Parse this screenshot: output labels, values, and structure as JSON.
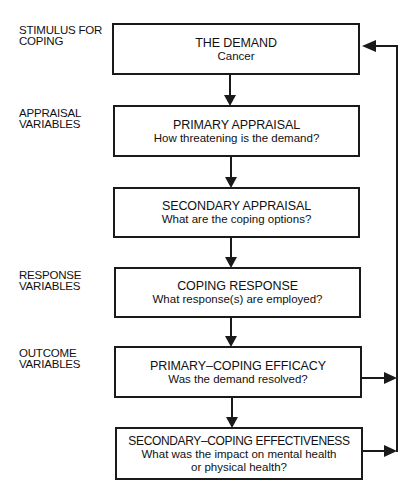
{
  "diagram": {
    "categories": [
      {
        "id": "stimulus",
        "lines": [
          "STIMULUS FOR",
          "COPING"
        ]
      },
      {
        "id": "appraisal",
        "lines": [
          "APPRAISAL",
          "VARIABLES"
        ]
      },
      {
        "id": "response",
        "lines": [
          "RESPONSE",
          "VARIABLES"
        ]
      },
      {
        "id": "outcome",
        "lines": [
          "OUTCOME",
          "VARIABLES"
        ]
      }
    ],
    "nodes": [
      {
        "id": "demand",
        "title": "THE DEMAND",
        "subtitle": "Cancer"
      },
      {
        "id": "primary-appraisal",
        "title": "PRIMARY APPRAISAL",
        "subtitle": "How threatening is the demand?"
      },
      {
        "id": "secondary-appraisal",
        "title": "SECONDARY APPRAISAL",
        "subtitle": "What are the coping options?"
      },
      {
        "id": "coping-response",
        "title": "COPING RESPONSE",
        "subtitle": "What response(s) are employed?"
      },
      {
        "id": "primary-coping-efficacy",
        "title": "PRIMARY–COPING EFFICACY",
        "subtitle": "Was the demand resolved?"
      },
      {
        "id": "secondary-coping-effectiveness",
        "title": "SECONDARY–COPING EFFECTIVENESS",
        "subtitle": "What was the impact on mental health",
        "subtitle2": "or physical health?"
      }
    ],
    "edges": [
      {
        "from": "demand",
        "to": "primary-appraisal"
      },
      {
        "from": "primary-appraisal",
        "to": "secondary-appraisal"
      },
      {
        "from": "secondary-appraisal",
        "to": "coping-response"
      },
      {
        "from": "coping-response",
        "to": "primary-coping-efficacy"
      },
      {
        "from": "primary-coping-efficacy",
        "to": "secondary-coping-effectiveness"
      },
      {
        "from": "primary-coping-efficacy",
        "to": "demand",
        "type": "feedback"
      },
      {
        "from": "secondary-coping-effectiveness",
        "to": "demand",
        "type": "feedback"
      }
    ],
    "colors": {
      "line": "#1a1a1a",
      "background": "#ffffff"
    }
  }
}
